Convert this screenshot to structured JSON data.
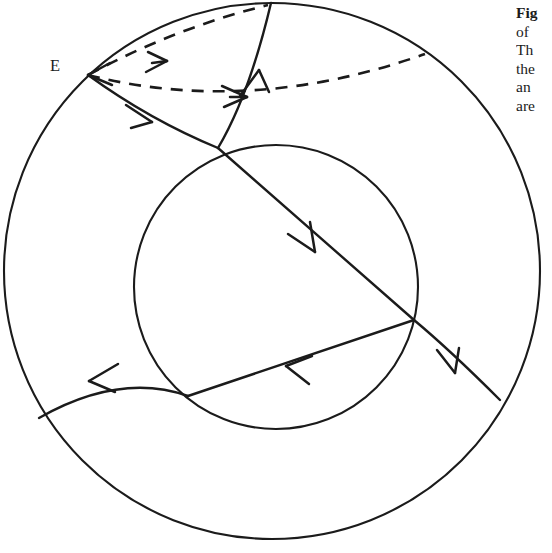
{
  "figure": {
    "background_color": "#ffffff",
    "stroke_color": "#1b1b1b",
    "labels": [
      {
        "name": "E",
        "text": "E",
        "x": 50,
        "y": 58
      }
    ],
    "outer_circle": {
      "label": "outer boundary circle",
      "cx": 272,
      "cy": 271,
      "r": 268
    },
    "inner_circle": {
      "label": "inner circle",
      "cx": 276,
      "cy": 287,
      "r": 142
    },
    "dashed_curves": [
      {
        "name": "dashed-curve-upper",
        "from": "E",
        "to": "top of outer circle",
        "arrow_at": [
          160,
          62
        ],
        "path": "M 88 75 Q 175 28 268 5"
      },
      {
        "name": "dashed-curve-lower",
        "from": "E",
        "to": "upper right of outer circle",
        "arrow_at": [
          239,
          96
        ],
        "path": "M 88 75 Q 250 116 425 54"
      }
    ],
    "solid_curves": [
      {
        "name": "solid-curve-E-to-top-vertex",
        "from": "E",
        "to": "top vertex",
        "arrow_at": [
          142,
          118
        ],
        "path": "M 88 75 Q 150 120 218 148"
      },
      {
        "name": "solid-curve-top-vertex-to-boundary",
        "from": "top vertex",
        "to": "top of outer circle",
        "arrow_at": [
          258,
          78
        ],
        "path": "M 218 148 Q 249 96 271 3"
      },
      {
        "name": "solid-curve-top-vertex-to-right-vertex",
        "from": "top vertex",
        "to": "right vertex",
        "arrow_at": [
          307,
          243
        ],
        "path": "M 218 148 L 414 320"
      },
      {
        "name": "solid-curve-right-vertex-to-left-vertex",
        "from": "right vertex",
        "to": "left vertex",
        "arrow_at": [
          294,
          374
        ],
        "path": "M 414 320 L 188 396"
      },
      {
        "name": "solid-curve-left-vertex-to-boundary",
        "from": "left vertex",
        "to": "left of outer circle",
        "arrow_at": [
          98,
          382
        ],
        "path": "M 188 396 Q 120 372 39 418"
      },
      {
        "name": "solid-curve-right-vertex-to-boundary",
        "from": "right vertex",
        "to": "lower right of outer circle",
        "arrow_at": [
          455,
          362
        ],
        "path": "M 414 320 Q 450 350 500 400"
      }
    ],
    "vertices": [
      {
        "name": "vertex-E",
        "x": 88,
        "y": 75
      },
      {
        "name": "vertex-top",
        "x": 218,
        "y": 148
      },
      {
        "name": "vertex-right",
        "x": 414,
        "y": 320
      },
      {
        "name": "vertex-left",
        "x": 188,
        "y": 396
      }
    ]
  },
  "caption": {
    "name": "figure-caption",
    "clipped": true,
    "lines": [
      {
        "text": "Fig",
        "bold": true
      },
      {
        "text": "of",
        "bold": false
      },
      {
        "text": "Th",
        "bold": false
      },
      {
        "text": "the",
        "bold": false
      },
      {
        "text": "an",
        "bold": false
      },
      {
        "text": "are",
        "bold": false
      }
    ]
  }
}
